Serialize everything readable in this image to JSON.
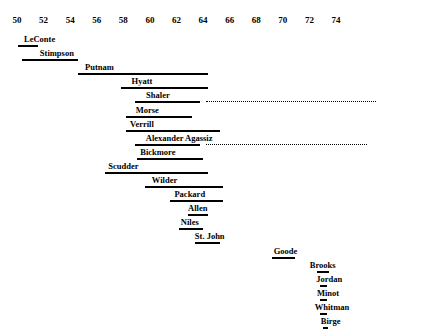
{
  "chart_data": {
    "type": "bar",
    "title": "",
    "subtitle": "",
    "xlabel": "",
    "ylabel": "",
    "orientation": "horizontal",
    "grid": false,
    "legend": null,
    "xlim": [
      49,
      75
    ],
    "axis_ticks": [
      50,
      52,
      54,
      56,
      58,
      60,
      62,
      64,
      66,
      68,
      70,
      72,
      74
    ],
    "tick_labels": [
      "50",
      "52",
      "54",
      "56",
      "58",
      "60",
      "62",
      "64",
      "66",
      "68",
      "70",
      "72",
      "74"
    ],
    "categories": [
      "LeConte",
      "Stimpson",
      "Putnam",
      "Hyatt",
      "Shaler",
      "Morse",
      "Verrill",
      "Alexander Agassiz",
      "Bickmore",
      "Scudder",
      "Wilder",
      "Packard",
      "Allen",
      "Niles",
      "St. John",
      "Goode",
      "Brooks",
      "Jordan",
      "Minot",
      "Whitman",
      "Birge"
    ],
    "bars": [
      {
        "label": "LeConte",
        "start": 50.1,
        "end": 51.6,
        "label_x": 51.7,
        "dotted_end": null
      },
      {
        "label": "Stimpson",
        "start": 50.4,
        "end": 54.6,
        "label_x": 53.0,
        "dotted_end": null
      },
      {
        "label": "Putnam",
        "start": 54.6,
        "end": 64.4,
        "label_x": 56.2,
        "dotted_end": null
      },
      {
        "label": "Hyatt",
        "start": 57.8,
        "end": 64.4,
        "label_x": 59.4,
        "dotted_end": null
      },
      {
        "label": "Shaler",
        "start": 58.9,
        "end": 63.8,
        "label_x": 60.6,
        "dotted_end": 77.0
      },
      {
        "label": "Morse",
        "start": 58.2,
        "end": 63.2,
        "label_x": 59.8,
        "dotted_end": null
      },
      {
        "label": "Verrill",
        "start": 58.2,
        "end": 65.3,
        "label_x": 59.4,
        "dotted_end": null
      },
      {
        "label": "Alexander Agassiz",
        "start": 58.9,
        "end": 63.8,
        "label_x": 62.2,
        "dotted_end": 76.3
      },
      {
        "label": "Bickmore",
        "start": 59.0,
        "end": 64.0,
        "label_x": 60.6,
        "dotted_end": null
      },
      {
        "label": "Scudder",
        "start": 56.6,
        "end": 64.4,
        "label_x": 58.0,
        "dotted_end": null
      },
      {
        "label": "Wilder",
        "start": 59.6,
        "end": 65.5,
        "label_x": 61.1,
        "dotted_end": null
      },
      {
        "label": "Packard",
        "start": 61.5,
        "end": 65.5,
        "label_x": 63.0,
        "dotted_end": null
      },
      {
        "label": "Allen",
        "start": 62.9,
        "end": 64.4,
        "label_x": 63.6,
        "dotted_end": null
      },
      {
        "label": "Niles",
        "start": 62.2,
        "end": 64.0,
        "label_x": 63.0,
        "dotted_end": null
      },
      {
        "label": "St. John",
        "start": 63.4,
        "end": 65.3,
        "label_x": 64.5,
        "dotted_end": null
      },
      {
        "label": "Goode",
        "start": 69.2,
        "end": 70.9,
        "label_x": 70.2,
        "dotted_end": null
      },
      {
        "label": "Brooks",
        "start": 72.6,
        "end": 73.5,
        "label_x": 73.0,
        "dotted_end": null
      },
      {
        "label": "Jordan",
        "start": 72.8,
        "end": 73.3,
        "label_x": 73.5,
        "dotted_end": null
      },
      {
        "label": "Minot",
        "start": 72.8,
        "end": 73.3,
        "label_x": 73.4,
        "dotted_end": null
      },
      {
        "label": "Whitman",
        "start": 72.8,
        "end": 73.3,
        "label_x": 73.7,
        "dotted_end": null
      },
      {
        "label": "Birge",
        "start": 73.0,
        "end": 73.4,
        "label_x": 73.6,
        "dotted_end": null
      }
    ]
  }
}
